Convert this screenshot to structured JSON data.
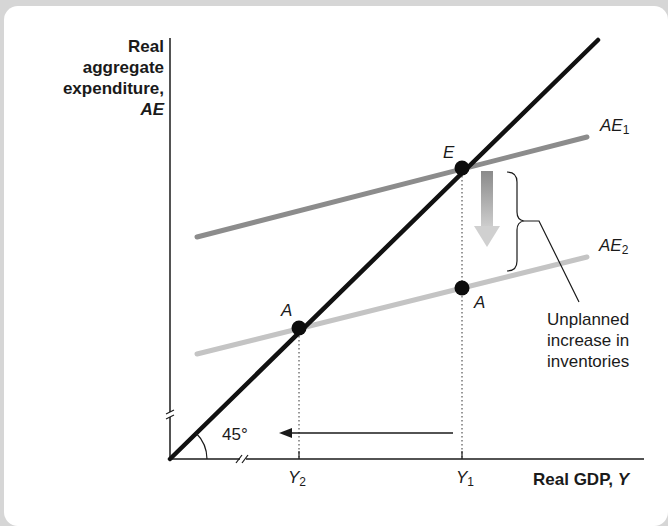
{
  "diagram": {
    "y_axis": {
      "label_lines": [
        "Real",
        "aggregate",
        "expenditure,"
      ],
      "label_italic": "AE"
    },
    "x_axis": {
      "label": "Real GDP, ",
      "label_italic": "Y",
      "ticks": [
        {
          "name": "Y",
          "sub": "2"
        },
        {
          "name": "Y",
          "sub": "1"
        }
      ]
    },
    "lines": {
      "forty_five": {
        "label": "45°",
        "color": "#111111"
      },
      "ae1": {
        "name": "AE",
        "sub": "1",
        "color": "#8c8c8c"
      },
      "ae2": {
        "name": "AE",
        "sub": "2",
        "color": "#c4c4c4"
      }
    },
    "points": {
      "e": "E",
      "a_right": "A",
      "a_left": "A"
    },
    "annotation": {
      "lines": [
        "Unplanned",
        "increase in",
        "inventories"
      ]
    },
    "colors": {
      "axis": "#1a1a1a",
      "forty_five": "#111111",
      "ae1": "#8c8c8c",
      "ae2": "#c4c4c4",
      "background": "#ffffff",
      "page": "#d6d6d6"
    }
  }
}
